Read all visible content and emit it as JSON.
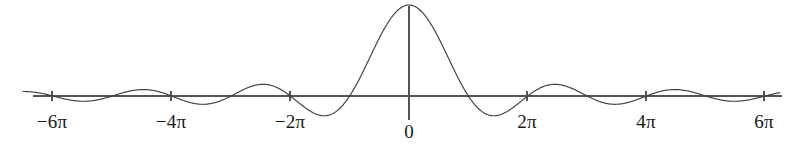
{
  "figure": {
    "width": 802,
    "height": 151,
    "background_color": "#ffffff",
    "curve_color": "#3f3f3f",
    "axis_color": "#555555",
    "label_color": "#1a1a1a"
  },
  "axes": {
    "origin_x_px": 409,
    "baseline_y_px": 96,
    "x_axis_start_px": 33,
    "x_axis_end_px": 782,
    "y_axis_top_px": 6,
    "y_axis_bottom_px": 120,
    "px_per_2pi": 118.7,
    "peak_height_px": 91,
    "tick_half_length_px": 5
  },
  "tick_labels": [
    {
      "text": "−6π",
      "name": "x-tick-label-minus-6pi",
      "x_px": 52,
      "label_y_px": 112,
      "value": -18.8496
    },
    {
      "text": "−4π",
      "name": "x-tick-label-minus-4pi",
      "x_px": 171,
      "label_y_px": 112,
      "value": -12.5664
    },
    {
      "text": "−2π",
      "name": "x-tick-label-minus-2pi",
      "x_px": 290,
      "label_y_px": 112,
      "value": -6.2832
    },
    {
      "text": "0",
      "name": "x-tick-label-zero",
      "x_px": 409,
      "label_y_px": 122,
      "value": 0
    },
    {
      "text": "2π",
      "name": "x-tick-label-2pi",
      "x_px": 527,
      "label_y_px": 112,
      "value": 6.2832
    },
    {
      "text": "4π",
      "name": "x-tick-label-4pi",
      "x_px": 646,
      "label_y_px": 112,
      "value": 12.5664
    },
    {
      "text": "6π",
      "name": "x-tick-label-6pi",
      "x_px": 764,
      "label_y_px": 112,
      "value": 18.8496
    }
  ],
  "chart_data": {
    "type": "line",
    "title": "",
    "subtitle": "",
    "xlabel": "",
    "ylabel": "",
    "grid": false,
    "legend": false,
    "legend_position": "none",
    "xlim": [
      -20.42,
      19.63
    ],
    "ylim": [
      -0.24,
      1.05
    ],
    "xticks": [
      -18.8496,
      -12.5664,
      -6.2832,
      0,
      6.2832,
      12.5664,
      18.8496
    ],
    "xticklabels": [
      "−6π",
      "−4π",
      "−2π",
      "0",
      "2π",
      "4π",
      "6π"
    ],
    "yticks": [],
    "yticklabels": [],
    "series": [
      {
        "name": "sinc",
        "formula": "y = sin(x)/x",
        "color": "#3f3f3f",
        "linewidth": 1,
        "x_min": -20.42,
        "x_max": 19.63,
        "samples": 1400,
        "key_points": [
          {
            "x": 0,
            "y": 1.0,
            "kind": "main-peak"
          },
          {
            "x": -3.1416,
            "y": 0.0,
            "kind": "zero"
          },
          {
            "x": 3.1416,
            "y": 0.0,
            "kind": "zero"
          },
          {
            "x": -4.4934,
            "y": -0.2172,
            "kind": "minimum"
          },
          {
            "x": 4.4934,
            "y": -0.2172,
            "kind": "minimum"
          },
          {
            "x": -6.2832,
            "y": 0.0,
            "kind": "zero"
          },
          {
            "x": 6.2832,
            "y": 0.0,
            "kind": "zero"
          },
          {
            "x": -7.7253,
            "y": 0.1284,
            "kind": "maximum"
          },
          {
            "x": 7.7253,
            "y": 0.1284,
            "kind": "maximum"
          },
          {
            "x": -9.4248,
            "y": 0.0,
            "kind": "zero"
          },
          {
            "x": 9.4248,
            "y": 0.0,
            "kind": "zero"
          },
          {
            "x": -10.9041,
            "y": -0.0913,
            "kind": "minimum"
          },
          {
            "x": 10.9041,
            "y": -0.0913,
            "kind": "minimum"
          },
          {
            "x": -12.5664,
            "y": 0.0,
            "kind": "zero"
          },
          {
            "x": 12.5664,
            "y": 0.0,
            "kind": "zero"
          },
          {
            "x": -14.0662,
            "y": 0.0709,
            "kind": "maximum"
          },
          {
            "x": 14.0662,
            "y": 0.0709,
            "kind": "maximum"
          },
          {
            "x": -15.708,
            "y": 0.0,
            "kind": "zero"
          },
          {
            "x": 15.708,
            "y": 0.0,
            "kind": "zero"
          },
          {
            "x": -17.2208,
            "y": -0.058,
            "kind": "minimum"
          },
          {
            "x": 17.2208,
            "y": -0.058,
            "kind": "minimum"
          },
          {
            "x": -18.8496,
            "y": 0.0,
            "kind": "zero"
          },
          {
            "x": 18.8496,
            "y": 0.0,
            "kind": "zero"
          }
        ]
      }
    ]
  }
}
